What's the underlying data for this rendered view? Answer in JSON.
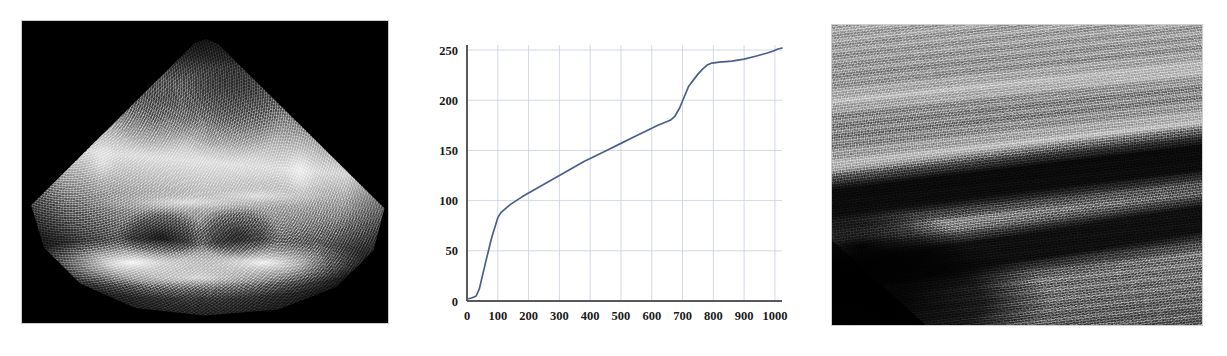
{
  "figure": {
    "panel_count": 3,
    "background_color": "#ffffff"
  },
  "panels": [
    {
      "id": "echo",
      "name": "cardiac-ultrasound-image",
      "modality": "B-mode echocardiogram",
      "view": "apical four-chamber sector scan",
      "background_color": "#000000",
      "alt": "Grayscale sector-format echocardiogram showing four cardiac chambers on a black background"
    },
    {
      "id": "chart",
      "name": "intensity-transfer-curve-chart",
      "alt": "Monotonically increasing blue line plot on a light grid"
    },
    {
      "id": "linear",
      "name": "linear-array-ultrasound-image",
      "modality": "B-mode linear array",
      "alt": "Grayscale linear-array ultrasound showing diagonal bright tissue layers and dark anechoic bands"
    }
  ],
  "chart_data": {
    "type": "line",
    "title": "",
    "xlabel": "",
    "ylabel": "",
    "xlim": [
      0,
      1023
    ],
    "ylim": [
      0,
      255
    ],
    "xticks": [
      0,
      100,
      200,
      300,
      400,
      500,
      600,
      700,
      800,
      900,
      1000
    ],
    "yticks": [
      0,
      50,
      100,
      150,
      200,
      250
    ],
    "xtick_labels": [
      "0",
      "100",
      "200",
      "300",
      "400",
      "500",
      "600",
      "700",
      "800",
      "900",
      "1000"
    ],
    "ytick_labels": [
      "0",
      "50",
      "100",
      "150",
      "200",
      "250"
    ],
    "grid": true,
    "legend": false,
    "line_color": "#4a5f8c",
    "grid_color": "#c8cfdd",
    "axis_color": "#595959",
    "series": [
      {
        "name": "transfer curve",
        "x": [
          0,
          15,
          30,
          40,
          60,
          80,
          100,
          110,
          140,
          180,
          220,
          260,
          300,
          340,
          380,
          420,
          460,
          500,
          540,
          580,
          620,
          660,
          675,
          690,
          705,
          720,
          735,
          750,
          765,
          780,
          795,
          820,
          860,
          900,
          940,
          975,
          995,
          1010,
          1023
        ],
        "y": [
          2,
          3,
          5,
          12,
          38,
          63,
          83,
          88,
          96,
          104,
          111,
          118,
          125,
          132,
          139,
          145,
          151,
          157,
          163,
          169,
          175,
          180,
          184,
          192,
          203,
          214,
          220,
          226,
          231,
          235,
          237,
          238,
          239,
          241,
          244,
          247,
          249,
          251,
          252
        ]
      }
    ]
  }
}
